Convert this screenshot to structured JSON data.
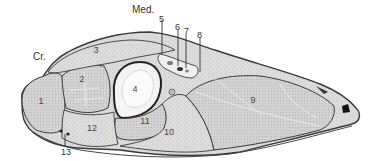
{
  "diagram": {
    "type": "anatomical-cross-section",
    "orientation_labels": {
      "medial": "Med.",
      "cranial": "Cr."
    },
    "regions": [
      {
        "id": "1",
        "label": "1"
      },
      {
        "id": "2",
        "label": "2"
      },
      {
        "id": "3",
        "label": "3"
      },
      {
        "id": "4",
        "label": "4"
      },
      {
        "id": "9",
        "label": "9"
      },
      {
        "id": "10",
        "label": "10"
      },
      {
        "id": "11",
        "label": "11"
      },
      {
        "id": "12",
        "label": "12"
      }
    ],
    "callouts": [
      {
        "id": "5",
        "label": "5"
      },
      {
        "id": "6",
        "label": "6"
      },
      {
        "id": "7",
        "label": "7"
      },
      {
        "id": "8",
        "label": "8"
      },
      {
        "id": "13",
        "label": "13"
      }
    ],
    "colors": {
      "tissue_fill": "#d9d9d9",
      "outline": "#3a3a3a",
      "bone_fill": "#f4f4f4",
      "background": "#ffffff"
    }
  }
}
